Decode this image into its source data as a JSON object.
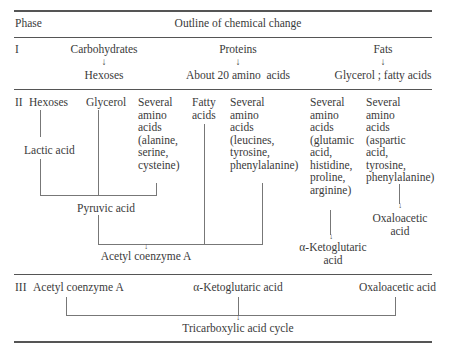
{
  "header": {
    "phase_label": "Phase",
    "outline_label": "Outline of chemical change"
  },
  "phase1": {
    "label": "I",
    "carbohydrates": "Carbohydrates",
    "hexoses": "Hexoses",
    "proteins": "Proteins",
    "amino_acids": "About 20 amino  acids",
    "fats": "Fats",
    "glycerol_fatty": "Glycerol ; fatty acids",
    "arrow": "↓"
  },
  "phase2": {
    "label": "II",
    "hexoses": "Hexoses",
    "glycerol": "Glycerol",
    "amino1": "Several\namino\nacids\n(alanine,\nserine,\ncysteine)",
    "fatty_acids": "Fatty\nacids",
    "amino2": "Several\namino\nacids\n(leucines,\ntyrosine,\nphenylalanine)",
    "amino3": "Several\namino\nacids\n(glutamic\nacid,\nhistidine,\nproline,\narginine)",
    "amino4": "Several\namino\nacids\n(aspartic\nacid,\ntyrosine,\nphenylalanine)",
    "lactic_acid": "Lactic acid",
    "pyruvic_acid": "Pyruvic acid",
    "acetyl_coa": "Acetyl coenzyme A",
    "ketoglutaric": "α-Ketoglutaric\nacid",
    "oxaloacetic": "Oxaloacetic\nacid",
    "arrow": "↓"
  },
  "phase3": {
    "label": "III",
    "acetyl_coa": "Acetyl coenzyme A",
    "ketoglutaric": "α-Ketoglutaric acid",
    "oxaloacetic": "Oxaloacetic acid",
    "tca": "Tricarboxylic acid cycle",
    "arrow": "↓"
  }
}
